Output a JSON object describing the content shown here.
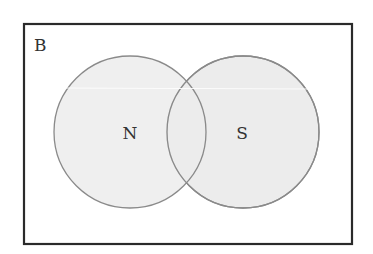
{
  "diagram": {
    "type": "venn",
    "universe": {
      "label": "B"
    },
    "sets": [
      {
        "label": "N"
      },
      {
        "label": "S"
      }
    ],
    "colors": {
      "fill": "#ececec",
      "stroke": "#8a8a8a",
      "border": "#2a2a2a"
    }
  }
}
